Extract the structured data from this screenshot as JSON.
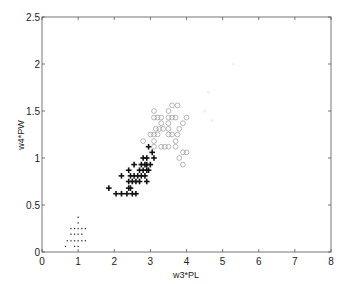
{
  "chart_data": {
    "type": "scatter",
    "title": "",
    "xlabel": "w3*PL",
    "ylabel": "w4*PW",
    "xlim": [
      0,
      8
    ],
    "ylim": [
      0,
      2.5
    ],
    "xticks": [
      0,
      1,
      2,
      3,
      4,
      5,
      6,
      7,
      8
    ],
    "yticks": [
      0,
      0.5,
      1,
      1.5,
      2,
      2.5
    ],
    "ytick_labels": [
      "0",
      "0.5",
      "1",
      "1.5",
      "2",
      "2.5"
    ],
    "grid": false,
    "legend": null,
    "series": [
      {
        "name": "class-1",
        "marker": "dot",
        "color": "#333333",
        "points": [
          [
            1.0,
            0.37
          ],
          [
            1.0,
            0.31
          ],
          [
            0.8,
            0.25
          ],
          [
            0.9,
            0.25
          ],
          [
            1.0,
            0.25
          ],
          [
            1.1,
            0.25
          ],
          [
            1.2,
            0.25
          ],
          [
            0.8,
            0.19
          ],
          [
            0.9,
            0.19
          ],
          [
            1.0,
            0.19
          ],
          [
            1.1,
            0.19
          ],
          [
            0.7,
            0.12
          ],
          [
            0.8,
            0.12
          ],
          [
            0.9,
            0.12
          ],
          [
            1.0,
            0.12
          ],
          [
            1.1,
            0.12
          ],
          [
            1.2,
            0.12
          ],
          [
            0.65,
            0.06
          ],
          [
            0.9,
            0.06
          ],
          [
            1.0,
            0.06
          ]
        ]
      },
      {
        "name": "class-2",
        "marker": "plus",
        "color": "#111111",
        "points": [
          [
            1.85,
            0.68
          ],
          [
            2.05,
            0.62
          ],
          [
            2.2,
            0.62
          ],
          [
            2.35,
            0.62
          ],
          [
            2.5,
            0.62
          ],
          [
            2.6,
            0.62
          ],
          [
            2.4,
            0.68
          ],
          [
            2.45,
            0.68
          ],
          [
            2.4,
            0.75
          ],
          [
            2.5,
            0.75
          ],
          [
            2.6,
            0.75
          ],
          [
            2.7,
            0.75
          ],
          [
            2.9,
            0.75
          ],
          [
            2.45,
            0.81
          ],
          [
            2.55,
            0.81
          ],
          [
            2.65,
            0.81
          ],
          [
            2.75,
            0.81
          ],
          [
            2.85,
            0.81
          ],
          [
            2.2,
            0.81
          ],
          [
            2.4,
            0.87
          ],
          [
            2.7,
            0.87
          ],
          [
            2.8,
            0.87
          ],
          [
            2.9,
            0.87
          ],
          [
            2.95,
            0.87
          ],
          [
            2.55,
            0.93
          ],
          [
            2.75,
            0.93
          ],
          [
            2.85,
            0.93
          ],
          [
            2.9,
            0.93
          ],
          [
            3.0,
            0.93
          ],
          [
            2.8,
            1.0
          ],
          [
            2.9,
            1.0
          ],
          [
            3.1,
            1.0
          ],
          [
            3.05,
            1.06
          ],
          [
            2.95,
            1.12
          ]
        ]
      },
      {
        "name": "class-3",
        "marker": "circle",
        "color": "#999999",
        "points": [
          [
            3.1,
            1.12
          ],
          [
            3.3,
            1.12
          ],
          [
            3.4,
            1.12
          ],
          [
            3.5,
            1.12
          ],
          [
            3.7,
            1.12
          ],
          [
            2.8,
            1.18
          ],
          [
            3.1,
            1.18
          ],
          [
            3.0,
            1.25
          ],
          [
            3.1,
            1.25
          ],
          [
            3.2,
            1.25
          ],
          [
            3.5,
            1.25
          ],
          [
            3.6,
            1.25
          ],
          [
            3.15,
            1.31
          ],
          [
            3.25,
            1.31
          ],
          [
            3.35,
            1.31
          ],
          [
            3.5,
            1.31
          ],
          [
            3.8,
            1.31
          ],
          [
            3.3,
            1.37
          ],
          [
            3.5,
            1.37
          ],
          [
            3.9,
            1.37
          ],
          [
            3.1,
            1.43
          ],
          [
            3.2,
            1.43
          ],
          [
            3.3,
            1.43
          ],
          [
            3.5,
            1.43
          ],
          [
            3.6,
            1.43
          ],
          [
            3.7,
            1.43
          ],
          [
            4.0,
            1.43
          ],
          [
            3.1,
            1.5
          ],
          [
            3.5,
            1.5
          ],
          [
            3.6,
            1.56
          ],
          [
            3.75,
            1.56
          ],
          [
            3.9,
            1.06
          ],
          [
            4.0,
            1.06
          ],
          [
            3.8,
            1.0
          ],
          [
            3.9,
            0.93
          ],
          [
            3.7,
            1.18
          ],
          [
            3.75,
            1.25
          ]
        ]
      },
      {
        "name": "class-4",
        "marker": "faint",
        "color": "#f0f0f0",
        "points": [
          [
            5.3,
            2.0
          ],
          [
            4.6,
            1.7
          ],
          [
            4.5,
            1.5
          ],
          [
            4.7,
            1.4
          ],
          [
            4.1,
            1.0
          ]
        ]
      }
    ]
  }
}
